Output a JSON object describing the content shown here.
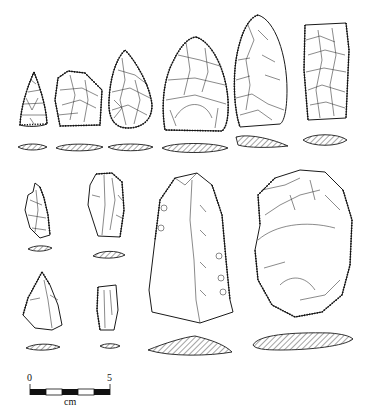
{
  "figure": {
    "ink_color": "#1a1a1a",
    "background_color": "#ffffff"
  },
  "artifacts": [
    {
      "id": 1,
      "shape": "small triangular point",
      "row": 1
    },
    {
      "id": 2,
      "shape": "trapezoidal scraper",
      "row": 1
    },
    {
      "id": 3,
      "shape": "ovate biface",
      "row": 1
    },
    {
      "id": 4,
      "shape": "broad biface",
      "row": 1
    },
    {
      "id": 5,
      "shape": "elongated biface",
      "row": 1
    },
    {
      "id": 6,
      "shape": "rectangular tool",
      "row": 1
    },
    {
      "id": 7,
      "shape": "small flake",
      "row": 2
    },
    {
      "id": 8,
      "shape": "blade fragment",
      "row": 2
    },
    {
      "id": 9,
      "shape": "triangular flake",
      "row": 3
    },
    {
      "id": 10,
      "shape": "small blade segment",
      "row": 3
    },
    {
      "id": 11,
      "shape": "large blade",
      "row": 2
    },
    {
      "id": 12,
      "shape": "core / large scraper",
      "row": 2
    }
  ],
  "scale_bar": {
    "start_label": "0",
    "end_label": "5",
    "unit_label": "cm",
    "segments": 5
  }
}
